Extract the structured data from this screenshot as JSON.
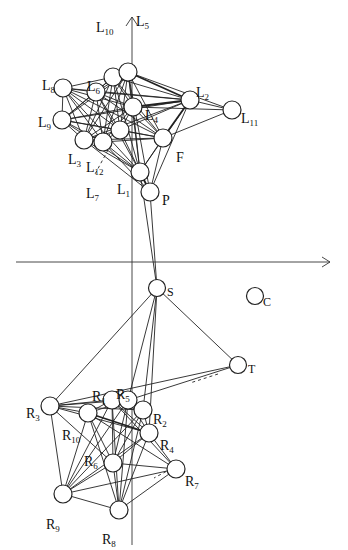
{
  "figure": {
    "type": "network-graph",
    "axes": {
      "origin": [
        132,
        262
      ],
      "x_axis_end": 330,
      "y_axis_top": 15,
      "arrow_color": "#333333"
    },
    "nodes": [
      {
        "id": "L10",
        "base": "L",
        "sub": "10",
        "x": 113,
        "y": 77,
        "lx": 96,
        "ly": 20,
        "ldir": "above"
      },
      {
        "id": "L5",
        "base": "L",
        "sub": "5",
        "x": 128,
        "y": 72,
        "lx": 136,
        "ly": 14,
        "ldir": "above"
      },
      {
        "id": "L8",
        "base": "L",
        "sub": "8",
        "x": 63,
        "y": 88,
        "lx": 42,
        "ly": 78,
        "ldir": "left"
      },
      {
        "id": "L6",
        "base": "L",
        "sub": "6",
        "x": 96,
        "y": 92,
        "lx": 87,
        "ly": 79,
        "ldir": "above"
      },
      {
        "id": "L9",
        "base": "L",
        "sub": "9",
        "x": 62,
        "y": 120,
        "lx": 38,
        "ly": 115,
        "ldir": "left"
      },
      {
        "id": "L4",
        "base": "L",
        "sub": "4",
        "x": 133,
        "y": 107,
        "lx": 145,
        "ly": 108,
        "ldir": "right"
      },
      {
        "id": "L2",
        "base": "L",
        "sub": "2",
        "x": 190,
        "y": 100,
        "lx": 196,
        "ly": 85,
        "ldir": "right"
      },
      {
        "id": "L11",
        "base": "L",
        "sub": "11",
        "x": 232,
        "y": 110,
        "lx": 241,
        "ly": 111,
        "ldir": "right"
      },
      {
        "id": "Lc",
        "base": "",
        "sub": "",
        "x": 120,
        "y": 130,
        "lx": 0,
        "ly": 0,
        "ldir": "none"
      },
      {
        "id": "L3",
        "base": "L",
        "sub": "3",
        "x": 84,
        "y": 140,
        "lx": 68,
        "ly": 152,
        "ldir": "below"
      },
      {
        "id": "L12",
        "base": "L",
        "sub": "12",
        "x": 103,
        "y": 142,
        "lx": 86,
        "ly": 160,
        "ldir": "below"
      },
      {
        "id": "F",
        "base": "F",
        "sub": "",
        "x": 163,
        "y": 138,
        "lx": 176,
        "ly": 150,
        "ldir": "right"
      },
      {
        "id": "L1",
        "base": "L",
        "sub": "1",
        "x": 140,
        "y": 172,
        "lx": 117,
        "ly": 182,
        "ldir": "left"
      },
      {
        "id": "P",
        "base": "P",
        "sub": "",
        "x": 150,
        "y": 192,
        "lx": 162,
        "ly": 193,
        "ldir": "right"
      },
      {
        "id": "S",
        "base": "S",
        "sub": "",
        "x": 157,
        "y": 288,
        "lx": 167,
        "ly": 284,
        "ldir": "right"
      },
      {
        "id": "C",
        "base": "C",
        "sub": "",
        "x": 255,
        "y": 296,
        "lx": 263,
        "ly": 294,
        "ldir": "right"
      },
      {
        "id": "T",
        "base": "T",
        "sub": "",
        "x": 238,
        "y": 365,
        "lx": 248,
        "ly": 361,
        "ldir": "right"
      },
      {
        "id": "R3",
        "base": "R",
        "sub": "3",
        "x": 50,
        "y": 406,
        "lx": 26,
        "ly": 406,
        "ldir": "left"
      },
      {
        "id": "R1",
        "base": "R",
        "sub": "1",
        "x": 112,
        "y": 400,
        "lx": 92,
        "ly": 389,
        "ldir": "above"
      },
      {
        "id": "R5",
        "base": "R",
        "sub": "5",
        "x": 128,
        "y": 400,
        "lx": 116,
        "ly": 387,
        "ldir": "above"
      },
      {
        "id": "R2",
        "base": "R",
        "sub": "2",
        "x": 143,
        "y": 410,
        "lx": 153,
        "ly": 412,
        "ldir": "right"
      },
      {
        "id": "R10",
        "base": "R",
        "sub": "10",
        "x": 88,
        "y": 413,
        "lx": 62,
        "ly": 428,
        "ldir": "left"
      },
      {
        "id": "R4",
        "base": "R",
        "sub": "4",
        "x": 149,
        "y": 433,
        "lx": 160,
        "ly": 438,
        "ldir": "right"
      },
      {
        "id": "R6",
        "base": "R",
        "sub": "6",
        "x": 113,
        "y": 463,
        "lx": 84,
        "ly": 454,
        "ldir": "left"
      },
      {
        "id": "R7",
        "base": "R",
        "sub": "7",
        "x": 176,
        "y": 469,
        "lx": 185,
        "ly": 474,
        "ldir": "right"
      },
      {
        "id": "R9",
        "base": "R",
        "sub": "9",
        "x": 63,
        "y": 494,
        "lx": 46,
        "ly": 517,
        "ldir": "below"
      },
      {
        "id": "R8",
        "base": "R",
        "sub": "8",
        "x": 119,
        "y": 510,
        "lx": 102,
        "ly": 532,
        "ldir": "below"
      }
    ],
    "edges": [
      [
        "L8",
        "L6"
      ],
      [
        "L8",
        "L9"
      ],
      [
        "L8",
        "L4"
      ],
      [
        "L8",
        "Lc"
      ],
      [
        "L8",
        "L3"
      ],
      [
        "L8",
        "L12"
      ],
      [
        "L8",
        "F"
      ],
      [
        "L8",
        "L1"
      ],
      [
        "L8",
        "L10"
      ],
      [
        "L8",
        "L2"
      ],
      [
        "L9",
        "L6"
      ],
      [
        "L9",
        "L10"
      ],
      [
        "L9",
        "L5"
      ],
      [
        "L9",
        "L4"
      ],
      [
        "L9",
        "Lc"
      ],
      [
        "L9",
        "L3"
      ],
      [
        "L9",
        "L12"
      ],
      [
        "L9",
        "F"
      ],
      [
        "L9",
        "L1"
      ],
      [
        "L9",
        "L2"
      ],
      [
        "L6",
        "L10"
      ],
      [
        "L6",
        "L5"
      ],
      [
        "L6",
        "L4"
      ],
      [
        "L6",
        "Lc"
      ],
      [
        "L6",
        "L3"
      ],
      [
        "L6",
        "L12"
      ],
      [
        "L6",
        "F"
      ],
      [
        "L6",
        "L1"
      ],
      [
        "L6",
        "L2"
      ],
      [
        "L10",
        "L5"
      ],
      [
        "L10",
        "L4"
      ],
      [
        "L10",
        "Lc"
      ],
      [
        "L10",
        "L3"
      ],
      [
        "L10",
        "L12"
      ],
      [
        "L10",
        "F"
      ],
      [
        "L10",
        "L1"
      ],
      [
        "L10",
        "L2"
      ],
      [
        "L5",
        "L4"
      ],
      [
        "L5",
        "Lc"
      ],
      [
        "L5",
        "L3"
      ],
      [
        "L5",
        "L12"
      ],
      [
        "L5",
        "F"
      ],
      [
        "L5",
        "L1"
      ],
      [
        "L5",
        "L2"
      ],
      [
        "L5",
        "L11"
      ],
      [
        "L5",
        "P"
      ],
      [
        "L4",
        "Lc"
      ],
      [
        "L4",
        "L3"
      ],
      [
        "L4",
        "L12"
      ],
      [
        "L4",
        "F"
      ],
      [
        "L4",
        "L1"
      ],
      [
        "L4",
        "L2"
      ],
      [
        "L4",
        "L11"
      ],
      [
        "Lc",
        "L3"
      ],
      [
        "Lc",
        "L12"
      ],
      [
        "Lc",
        "F"
      ],
      [
        "Lc",
        "L1"
      ],
      [
        "Lc",
        "L2"
      ],
      [
        "L3",
        "L12"
      ],
      [
        "L3",
        "F"
      ],
      [
        "L3",
        "L1"
      ],
      [
        "L3",
        "P"
      ],
      [
        "L3",
        "L2"
      ],
      [
        "L12",
        "F"
      ],
      [
        "L12",
        "L1"
      ],
      [
        "L12",
        "P"
      ],
      [
        "F",
        "L1"
      ],
      [
        "F",
        "P"
      ],
      [
        "F",
        "L2"
      ],
      [
        "F",
        "L11"
      ],
      [
        "L2",
        "L11"
      ],
      [
        "L2",
        "L1"
      ],
      [
        "L2",
        "P"
      ],
      [
        "L1",
        "P"
      ],
      [
        "L1",
        "S"
      ],
      [
        "P",
        "S"
      ],
      [
        "S",
        "R3"
      ],
      [
        "S",
        "R5"
      ],
      [
        "S",
        "R2"
      ],
      [
        "S",
        "T"
      ],
      [
        "S",
        "R4"
      ],
      [
        "T",
        "R3"
      ],
      [
        "T",
        "R10"
      ],
      [
        "R3",
        "R1"
      ],
      [
        "R3",
        "R5"
      ],
      [
        "R3",
        "R2"
      ],
      [
        "R3",
        "R10"
      ],
      [
        "R3",
        "R4"
      ],
      [
        "R3",
        "R9"
      ],
      [
        "R3",
        "R6"
      ],
      [
        "R1",
        "R5"
      ],
      [
        "R1",
        "R10"
      ],
      [
        "R1",
        "R6"
      ],
      [
        "R1",
        "R9"
      ],
      [
        "R1",
        "R8"
      ],
      [
        "R1",
        "R4"
      ],
      [
        "R1",
        "R7"
      ],
      [
        "R5",
        "R2"
      ],
      [
        "R5",
        "R6"
      ],
      [
        "R5",
        "R9"
      ],
      [
        "R5",
        "R8"
      ],
      [
        "R5",
        "R4"
      ],
      [
        "R2",
        "R4"
      ],
      [
        "R2",
        "R6"
      ],
      [
        "R2",
        "R9"
      ],
      [
        "R2",
        "R8"
      ],
      [
        "R10",
        "R4"
      ],
      [
        "R10",
        "R6"
      ],
      [
        "R10",
        "R9"
      ],
      [
        "R10",
        "R8"
      ],
      [
        "R10",
        "R7"
      ],
      [
        "R4",
        "R6"
      ],
      [
        "R4",
        "R7"
      ],
      [
        "R4",
        "R9"
      ],
      [
        "R4",
        "R8"
      ],
      [
        "R6",
        "R7"
      ],
      [
        "R6",
        "R9"
      ],
      [
        "R6",
        "R8"
      ],
      [
        "R7",
        "R9"
      ],
      [
        "R7",
        "R8"
      ],
      [
        "R9",
        "R8"
      ]
    ],
    "thick_edges": [
      [
        "L5",
        "L2"
      ],
      [
        "L4",
        "L2"
      ],
      [
        "F",
        "L2"
      ],
      [
        "R10",
        "R4"
      ],
      [
        "L1",
        "P"
      ]
    ],
    "dashed_edges": [
      [
        "L12",
        "L7"
      ]
    ],
    "extra_labels": [
      {
        "id": "L7",
        "base": "L",
        "sub": "7",
        "x": 86,
        "y": 186
      }
    ],
    "dashed_segments": [
      [
        108,
        150,
        94,
        176
      ],
      [
        182,
        463,
        154,
        478
      ],
      [
        218,
        374,
        190,
        383
      ]
    ]
  }
}
